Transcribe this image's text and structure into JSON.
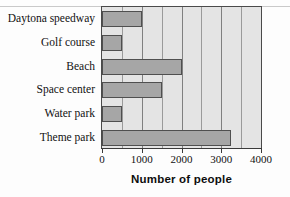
{
  "chart_data": {
    "type": "bar",
    "orientation": "horizontal",
    "title": "",
    "xlabel": "Number of people",
    "ylabel": "",
    "categories": [
      "Daytona speedway",
      "Golf course",
      "Beach",
      "Space center",
      "Water park",
      "Theme park"
    ],
    "values": [
      1000,
      500,
      2000,
      1500,
      500,
      3250
    ],
    "xlim": [
      0,
      4000
    ],
    "xticks": [
      0,
      1000,
      2000,
      3000,
      4000
    ],
    "xtick_labels": [
      "0",
      "1000",
      "2000",
      "3000",
      "4000"
    ],
    "minor_gridlines": [
      500,
      1000,
      1500,
      2000,
      2500,
      3000,
      3500
    ],
    "grid": true,
    "legend": "none",
    "colors": {
      "bar_fill": "#a6a6a6",
      "bar_stroke": "#4f4f4f",
      "plot_background": "#e4e4e4",
      "gridline": "#9a9a9a",
      "axis": "#3a3a3a",
      "text": "#111111"
    }
  },
  "axis": {
    "x_title": "Number of people"
  }
}
